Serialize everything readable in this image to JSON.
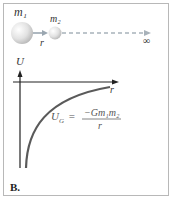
{
  "diagram": {
    "panel_label": "B.",
    "top": {
      "mass1_label": "m₁",
      "mass2_label": "m₂",
      "separation_label": "r",
      "infinity_label": "∞"
    },
    "graph": {
      "y_axis_label": "U",
      "x_axis_label": "r",
      "formula": {
        "lhs": "U",
        "lhs_subscript": "G",
        "equals": "=",
        "numerator": "−Gm₁m₂",
        "denominator": "r"
      }
    },
    "colors": {
      "curve": "#555555",
      "axes": "#222222",
      "arrow": "#8a9aa8",
      "sphere": "#dddddd",
      "border": "#b8b8b8"
    }
  }
}
